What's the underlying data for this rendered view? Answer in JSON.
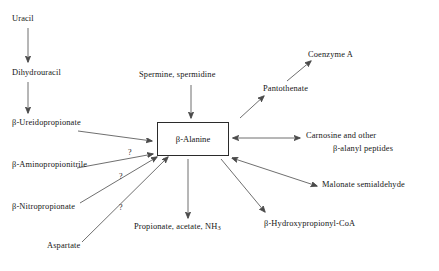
{
  "diagram": {
    "center": {
      "label": "β-Alanine"
    },
    "nodes": {
      "uracil": "Uracil",
      "dihydrouracil": "Dihydrouracil",
      "ureidopropionate": "β-Ureidopropionate",
      "aminopropionitrile": "β-Aminopropionitrile",
      "nitropropionate": "β-Nitropropionate",
      "aspartate": "Aspartate",
      "spermine": "Spermine, spermidine",
      "pantothenate": "Pantothenate",
      "coenzyme_a": "Coenzyme A",
      "carnosine_line1": "Carnosine and other",
      "carnosine_line2": "β-alanyl peptides",
      "malonate": "Malonate semialdehyde",
      "hydroxypropionyl": "β-Hydroxypropionyl-CoA",
      "propionate_pre": "Propionate, acetate, NH",
      "propionate_sub": "3"
    },
    "uncertainty_marks": [
      "?",
      "?",
      "?"
    ],
    "colors": {
      "ink": "#151515",
      "arrow": "#4a4a4a",
      "box_border": "#2b2b2b",
      "background": "#ffffff"
    }
  }
}
